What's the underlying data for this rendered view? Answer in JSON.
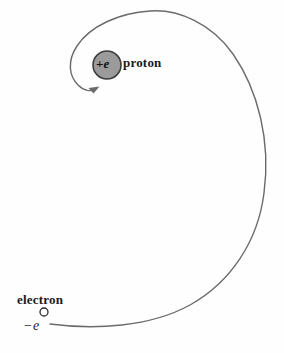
{
  "figure": {
    "type": "physics-diagram",
    "background_color": "#fefefe",
    "stroke_color": "#595959",
    "text_color": "#1a1a1a"
  },
  "proton": {
    "label": "proton",
    "charge_sign": "+",
    "charge_symbol": "e",
    "charge_text": "+e",
    "fill_color": "#9b9b9b",
    "border_color": "#3d3d3d",
    "center_x": 107,
    "center_y": 65,
    "radius": 14
  },
  "electron": {
    "label": "electron",
    "charge_sign": "−",
    "charge_symbol": "e",
    "charge_text": "−e",
    "fill_color": "#ffffff",
    "border_color": "#2b2b2b",
    "center_x": 44,
    "center_y": 312,
    "radius": 4
  },
  "trajectory": {
    "name": "inward-spiral-path",
    "stroke_color": "#6b6b6b",
    "stroke_width": 1.4,
    "direction": "inward",
    "arrowhead": "at-proton"
  }
}
